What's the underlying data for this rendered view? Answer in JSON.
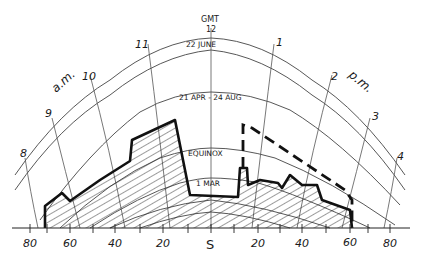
{
  "diagram": {
    "type": "sun-path-diagram-with-obstruction-mask",
    "top_label": {
      "line1": "GMT",
      "line2": "12"
    },
    "hour_labels_am": {
      "text": "a.m.",
      "hours": [
        "8",
        "9",
        "10",
        "11"
      ]
    },
    "hour_labels_pm": {
      "text": "p.m.",
      "hours": [
        "1",
        "2",
        "3",
        "4"
      ]
    },
    "date_curves": [
      {
        "label": "22 JUNE"
      },
      {
        "label": "21 APR - 24 AUG"
      },
      {
        "label": "EQUINOX"
      },
      {
        "label": "1 MAR"
      }
    ],
    "azimuth_axis": {
      "labels": [
        "80",
        "60",
        "40",
        "20",
        "S",
        "20",
        "40",
        "60",
        "80"
      ]
    },
    "legend_notes": {
      "solid_hatched": "existing obstruction outline (hatched)",
      "dashed": "proposed obstruction outline"
    },
    "colors": {
      "ink": "#1a1a1a",
      "grid": "#555555",
      "paper": "#ffffff"
    }
  }
}
